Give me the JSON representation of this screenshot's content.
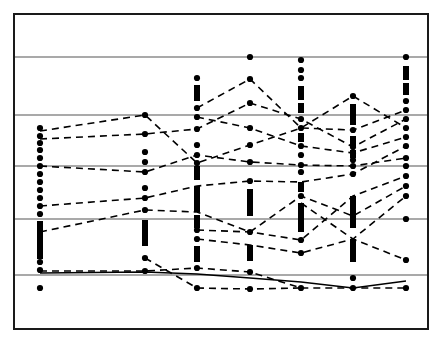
{
  "figure": {
    "background": "#ffffff",
    "width": 442,
    "height": 343,
    "frame": {
      "x": 14,
      "y": 14,
      "width": 414,
      "height": 315,
      "stroke": "#1a1a1a",
      "stroke_width": 2
    }
  },
  "style": {
    "gridline_color": "#555555",
    "gridline_width": 1.1,
    "marker_color": "#000000",
    "marker_radius": 3.1,
    "bar_color": "#000000",
    "bar_width": 6,
    "dashed_color": "#000000",
    "dashed_width": 1.6,
    "dash_pattern": "7,5",
    "solid_series_color": "#000000",
    "solid_series_width": 1.4
  },
  "chart_data": {
    "type": "scatter",
    "title": "",
    "subtitle": "",
    "xlabel": "",
    "ylabel": "",
    "grid": true,
    "legend": null,
    "legend_position": "none",
    "axis_ticks_visible": false,
    "tick_labels_visible": false,
    "x": [
      40,
      145,
      197,
      250,
      301,
      353,
      406
    ],
    "categories": [
      "1",
      "2",
      "3",
      "4",
      "5",
      "6",
      "7"
    ],
    "xlim": [
      14,
      428
    ],
    "ylim": [
      14,
      329
    ],
    "y_gridlines": [
      57,
      115,
      166,
      219,
      275
    ],
    "column_markers": [
      {
        "x": 40,
        "dots": [
          128,
          136,
          143,
          150,
          158,
          166,
          174,
          182,
          190,
          198,
          206,
          214,
          262,
          270,
          288
        ],
        "bars": [
          [
            221,
            259
          ]
        ]
      },
      {
        "x": 145,
        "dots": [
          115,
          134,
          152,
          162,
          172,
          188,
          198,
          210,
          258,
          271
        ],
        "bars": [
          [
            220,
            246
          ]
        ]
      },
      {
        "x": 197,
        "dots": [
          78,
          108,
          117,
          129,
          145,
          155,
          163,
          230,
          239,
          268,
          288
        ],
        "bars": [
          [
            85,
            101
          ],
          [
            166,
            180
          ],
          [
            186,
            212
          ],
          [
            215,
            228
          ],
          [
            246,
            262
          ]
        ]
      },
      {
        "x": 250,
        "dots": [
          57,
          79,
          103,
          128,
          145,
          162,
          181,
          232,
          272,
          289
        ],
        "bars": [
          [
            189,
            216
          ],
          [
            245,
            261
          ]
        ]
      },
      {
        "x": 301,
        "dots": [
          60,
          70,
          78,
          119,
          128,
          146,
          155,
          165,
          172,
          196,
          240,
          253,
          288
        ],
        "bars": [
          [
            86,
            100
          ],
          [
            103,
            113
          ],
          [
            133,
            142
          ],
          [
            182,
            192
          ],
          [
            203,
            232
          ]
        ]
      },
      {
        "x": 353,
        "dots": [
          96,
          130,
          147,
          153,
          160,
          166,
          174,
          216,
          278,
          288
        ],
        "bars": [
          [
            104,
            125
          ],
          [
            136,
            146
          ],
          [
            150,
            158
          ],
          [
            196,
            228
          ],
          [
            239,
            262
          ]
        ]
      },
      {
        "x": 406,
        "dots": [
          57,
          101,
          110,
          119,
          128,
          137,
          146,
          158,
          166,
          176,
          186,
          196,
          219,
          260,
          288
        ],
        "bars": [
          [
            66,
            80
          ],
          [
            83,
            95
          ]
        ]
      }
    ],
    "series": [
      {
        "name": "s1",
        "style": "dashed",
        "points": [
          [
            40,
            131
          ],
          [
            145,
            115
          ],
          [
            197,
            163
          ],
          [
            250,
            145
          ],
          [
            301,
            128
          ],
          [
            353,
            96
          ],
          [
            406,
            128
          ]
        ]
      },
      {
        "name": "s2",
        "style": "dashed",
        "points": [
          [
            40,
            139
          ],
          [
            145,
            134
          ],
          [
            197,
            129
          ],
          [
            250,
            103
          ],
          [
            301,
            119
          ],
          [
            353,
            147
          ],
          [
            406,
            119
          ]
        ]
      },
      {
        "name": "s3",
        "style": "dashed",
        "points": [
          [
            197,
            108
          ],
          [
            250,
            79
          ],
          [
            301,
            128
          ],
          [
            353,
            130
          ],
          [
            406,
            110
          ]
        ]
      },
      {
        "name": "s4",
        "style": "dashed",
        "points": [
          [
            40,
            166
          ],
          [
            145,
            172
          ],
          [
            197,
            155
          ],
          [
            250,
            162
          ],
          [
            301,
            165
          ],
          [
            353,
            166
          ],
          [
            406,
            158
          ]
        ]
      },
      {
        "name": "s5",
        "style": "dashed",
        "points": [
          [
            197,
            117
          ],
          [
            250,
            128
          ],
          [
            301,
            146
          ],
          [
            353,
            153
          ],
          [
            406,
            137
          ]
        ]
      },
      {
        "name": "s6",
        "style": "dashed",
        "points": [
          [
            40,
            206
          ],
          [
            145,
            198
          ],
          [
            197,
            186
          ],
          [
            250,
            181
          ],
          [
            301,
            182
          ],
          [
            353,
            174
          ],
          [
            406,
            146
          ]
        ]
      },
      {
        "name": "s7",
        "style": "dashed",
        "points": [
          [
            40,
            232
          ],
          [
            145,
            210
          ],
          [
            197,
            212
          ],
          [
            250,
            232
          ],
          [
            301,
            196
          ],
          [
            353,
            216
          ],
          [
            406,
            186
          ]
        ]
      },
      {
        "name": "s8",
        "style": "dashed",
        "points": [
          [
            197,
            230
          ],
          [
            250,
            232
          ],
          [
            301,
            240
          ],
          [
            353,
            196
          ],
          [
            406,
            176
          ]
        ]
      },
      {
        "name": "s9",
        "style": "dashed",
        "points": [
          [
            197,
            239
          ],
          [
            250,
            245
          ],
          [
            301,
            253
          ],
          [
            353,
            239
          ],
          [
            406,
            196
          ]
        ]
      },
      {
        "name": "s10",
        "style": "dashed",
        "points": [
          [
            40,
            271
          ],
          [
            145,
            271
          ],
          [
            197,
            268
          ],
          [
            250,
            272
          ],
          [
            301,
            288
          ],
          [
            353,
            288
          ],
          [
            406,
            288
          ]
        ]
      },
      {
        "name": "s11",
        "style": "dashed",
        "points": [
          [
            145,
            258
          ],
          [
            197,
            288
          ],
          [
            250,
            289
          ],
          [
            301,
            288
          ]
        ]
      },
      {
        "name": "s12",
        "style": "dashed",
        "points": [
          [
            301,
            203
          ],
          [
            353,
            239
          ],
          [
            406,
            260
          ]
        ]
      },
      {
        "name": "s13",
        "style": "solid",
        "points": [
          [
            40,
            273
          ],
          [
            145,
            272
          ],
          [
            197,
            274
          ],
          [
            250,
            278
          ],
          [
            301,
            282
          ],
          [
            353,
            288
          ],
          [
            406,
            281
          ]
        ]
      }
    ]
  }
}
